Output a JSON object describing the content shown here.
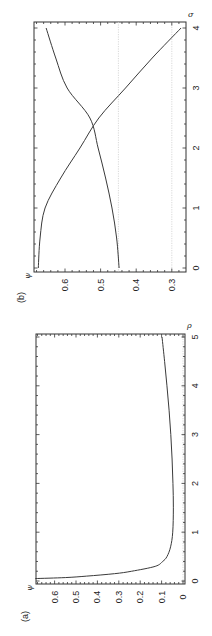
{
  "figure": {
    "orientation": "rotated 90 degrees counter-clockwise",
    "panels": [
      {
        "id": "b",
        "label": "(b)"
      },
      {
        "id": "a",
        "label": "(a)"
      }
    ]
  },
  "chart_data": [
    {
      "panel": "(a)",
      "type": "line",
      "title": "",
      "xlabel": "ρ",
      "ylabel": "ψ",
      "xlim": [
        0,
        5
      ],
      "ylim": [
        0,
        0.69
      ],
      "xticks": [
        "0",
        "1",
        "2",
        "3",
        "4",
        "5"
      ],
      "yticks": [
        "0",
        "0.1",
        "0.2",
        "0.3",
        "0.4",
        "0.5",
        "0.6"
      ],
      "grid": false,
      "reference_lines": [
        {
          "axis": "y",
          "value": 0.0,
          "style": "dotted gray"
        }
      ],
      "series": [
        {
          "name": "ψ(ρ)",
          "x": [
            0.05,
            0.07,
            0.1,
            0.15,
            0.2,
            0.3,
            0.4,
            0.5,
            0.7,
            1.0,
            1.5,
            2.0,
            2.5,
            3.0,
            3.5,
            4.0,
            4.5,
            5.0
          ],
          "y": [
            0.69,
            0.55,
            0.45,
            0.32,
            0.24,
            0.13,
            0.095,
            0.075,
            0.058,
            0.048,
            0.045,
            0.047,
            0.051,
            0.057,
            0.065,
            0.075,
            0.086,
            0.098
          ]
        }
      ]
    },
    {
      "panel": "(b)",
      "type": "line",
      "title": "",
      "xlabel": "σ",
      "ylabel": "ψ",
      "xlim": [
        0,
        4.1
      ],
      "ylim": [
        0.26,
        0.687
      ],
      "xticks": [
        "0",
        "1",
        "2",
        "3",
        "4"
      ],
      "yticks": [
        "0.3",
        "0.4",
        "0.5",
        "0.6"
      ],
      "grid": false,
      "reference_lines": [
        {
          "axis": "y",
          "value": 0.45,
          "style": "dotted gray"
        },
        {
          "axis": "y",
          "value": 0.3,
          "style": "dotted gray"
        }
      ],
      "intersection": {
        "x": 2.43,
        "y": 0.521
      },
      "series": [
        {
          "name": "decreasing branch",
          "x": [
            0,
            0.5,
            1.0,
            1.5,
            2.0,
            2.5,
            3.0,
            3.5,
            4.0
          ],
          "y": [
            0.675,
            0.67,
            0.656,
            0.612,
            0.558,
            0.505,
            0.43,
            0.355,
            0.274
          ]
        },
        {
          "name": "increasing branch",
          "x": [
            0,
            0.5,
            1.0,
            1.5,
            2.0,
            2.5,
            3.0,
            3.5,
            4.0
          ],
          "y": [
            0.448,
            0.455,
            0.468,
            0.486,
            0.507,
            0.53,
            0.594,
            0.626,
            0.653
          ]
        }
      ]
    }
  ]
}
